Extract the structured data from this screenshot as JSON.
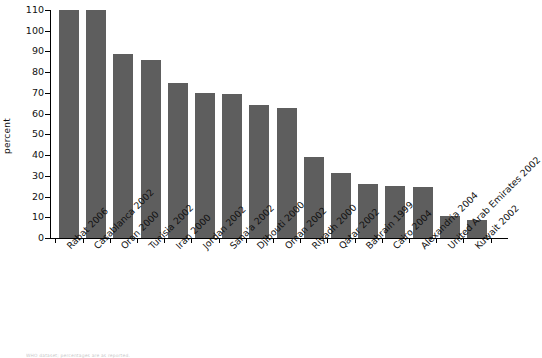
{
  "chart_data": {
    "type": "bar",
    "title": "",
    "subtitle": "",
    "xlabel": "",
    "ylabel": "percent",
    "ylim": [
      0,
      110
    ],
    "ytick_step": 10,
    "grid": false,
    "legend": null,
    "bar_color": "#5e5e5e",
    "axis_color": "#000000",
    "yticks": [
      110,
      100,
      90,
      80,
      70,
      60,
      50,
      40,
      30,
      20,
      10,
      0
    ],
    "categories": [
      "Rabat 2006",
      "Casablanca 2002",
      "Oran 2000",
      "Tunisia 2002",
      "Iran 2000",
      "Jordan 2002",
      "Sana'a 2002",
      "Djibouti 2000",
      "Oman 2002",
      "Riyadh 2000",
      "Qatar 2002",
      "Bahrain 1999",
      "Cairo 2004",
      "Alexandria 2004",
      "United Arab Emirates 2002",
      "Kuwait 2002"
    ],
    "values": [
      110,
      110,
      89,
      86,
      75,
      70,
      69.5,
      64,
      62.5,
      39,
      31.5,
      26,
      25,
      24.5,
      10.5,
      8.5
    ]
  },
  "footer": {
    "note": "WHO dataset; percentages are as reported."
  }
}
